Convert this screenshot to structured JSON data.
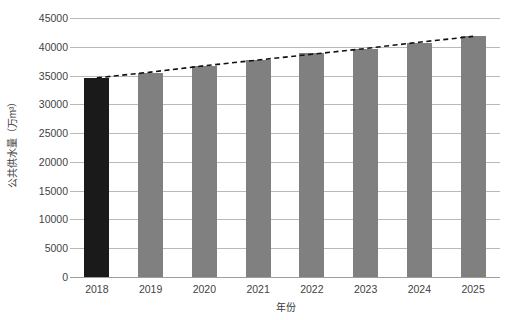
{
  "chart_data": {
    "type": "bar",
    "title": "",
    "subtitle": "",
    "xlabel": "年份",
    "ylabel": "公共供水量（万m³）",
    "categories": [
      "2018",
      "2019",
      "2020",
      "2021",
      "2022",
      "2023",
      "2024",
      "2025"
    ],
    "values": [
      34600,
      35500,
      36700,
      37700,
      38900,
      39600,
      40700,
      41800
    ],
    "series": [
      {
        "name": "公共供水量",
        "type": "bar",
        "values": [
          34600,
          35500,
          36700,
          37700,
          38900,
          39600,
          40700,
          41800
        ]
      },
      {
        "name": "趋势线",
        "type": "line",
        "style": "dashed",
        "color": "#111111",
        "values": [
          34600,
          35600,
          36700,
          37700,
          38700,
          39700,
          40800,
          41800
        ]
      }
    ],
    "bar_colors": [
      "#1a1a1a",
      "#808080",
      "#808080",
      "#808080",
      "#808080",
      "#808080",
      "#808080",
      "#808080"
    ],
    "highlight_index": 0,
    "ylim": [
      0,
      45000
    ],
    "ytick_values": [
      0,
      5000,
      10000,
      15000,
      20000,
      25000,
      30000,
      35000,
      40000,
      45000
    ],
    "ytick_labels": [
      "0",
      "5000",
      "10000",
      "15000",
      "20000",
      "25000",
      "30000",
      "35000",
      "40000",
      "45000"
    ],
    "grid": true,
    "grid_color": "#b9b9b9",
    "axis_color": "#9d9d9d",
    "legend": "none",
    "background": "#ffffff"
  }
}
